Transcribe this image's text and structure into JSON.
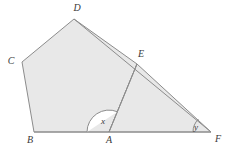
{
  "figure": {
    "background_color": "#ffffff",
    "fill_color": "#e8e8e8",
    "stroke_color": "#8c8c8c",
    "label_color": "#3a3a3a",
    "stroke_width": 1
  },
  "points": {
    "A": {
      "label": "A",
      "x": 109,
      "y": 132,
      "label_x": 109,
      "label_y": 143,
      "anchor": "middle"
    },
    "B": {
      "label": "B",
      "x": 34,
      "y": 132,
      "label_x": 30,
      "label_y": 143,
      "anchor": "middle"
    },
    "C": {
      "label": "C",
      "x": 22,
      "y": 62,
      "label_x": 11,
      "label_y": 64,
      "anchor": "middle"
    },
    "D": {
      "label": "D",
      "x": 74,
      "y": 19,
      "label_x": 77,
      "label_y": 10,
      "anchor": "middle"
    },
    "E": {
      "label": "E",
      "x": 137,
      "y": 64,
      "label_x": 141,
      "label_y": 57,
      "anchor": "middle"
    },
    "F": {
      "label": "F",
      "x": 211,
      "y": 132,
      "label_x": 218,
      "label_y": 142,
      "anchor": "middle"
    }
  },
  "shapes": {
    "pentagon": {
      "name": "pentagon-ABCDE",
      "vertex_order": "B, C, D, E, A",
      "path": "M 34 132 L 22 62 L 74 19 L 137 64 L 109 132 Z"
    },
    "triangle": {
      "name": "triangle-AEF",
      "vertex_order": "A, E, F",
      "path": "M 109 132 L 137 64 L 211 132 Z"
    }
  },
  "segments": [
    {
      "name": "segment-BF",
      "from": "B",
      "to": "F",
      "path": "M 34 132 L 211 132"
    },
    {
      "name": "segment-AE",
      "from": "A",
      "to": "E",
      "path": "M 109 132 L 137 64"
    },
    {
      "name": "segment-DF",
      "from": "D",
      "to": "F",
      "path": "M 74 19 L 211 132"
    }
  ],
  "angles": {
    "x": {
      "label": "x",
      "vertex": "A",
      "description": "angle at A between ray AB and ray AE, interior to pentagon",
      "arc_path": "M 87 132 A 22 22 0 0 1 117.37 111.73",
      "label_x": 103,
      "label_y": 124
    },
    "y": {
      "label": "y",
      "vertex": "F",
      "description": "angle at F between ray FA and ray FE",
      "arc_path": "M 193 132 A 18 18 0 0 1 198.43 119.13",
      "label_x": 196,
      "label_y": 130
    }
  }
}
